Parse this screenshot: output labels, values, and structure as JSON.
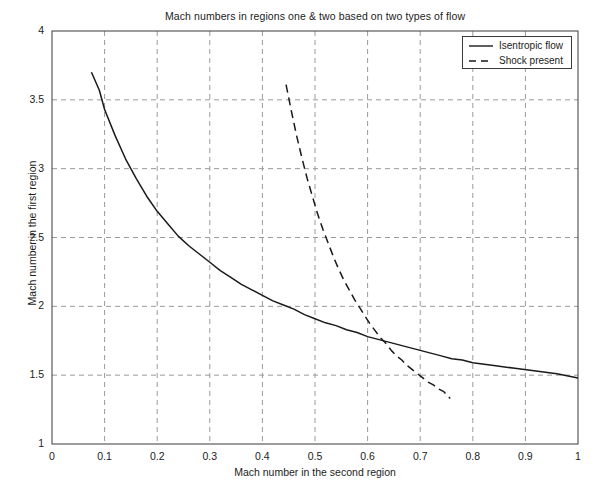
{
  "chart_data": {
    "type": "line",
    "title": "Mach numbers in regions one & two based on two types of flow",
    "xlabel": "Mach number in the second region",
    "ylabel": "Mach number in the first region",
    "xlim": [
      0,
      1
    ],
    "ylim": [
      1,
      4
    ],
    "grid": true,
    "grid_style": "dashed",
    "grid_color": "#9a9a9a",
    "legend_position": "top-right",
    "xticks": [
      "0",
      "0.1",
      "0.2",
      "0.3",
      "0.4",
      "0.5",
      "0.6",
      "0.7",
      "0.8",
      "0.9",
      "1"
    ],
    "xtick_values": [
      0,
      0.1,
      0.2,
      0.3,
      0.4,
      0.5,
      0.6,
      0.7,
      0.8,
      0.9,
      1
    ],
    "yticks": [
      "1",
      "1.5",
      "2",
      "2.5",
      "3",
      "3.5",
      "4"
    ],
    "ytick_values": [
      1,
      1.5,
      2,
      2.5,
      3,
      3.5,
      4
    ],
    "series": [
      {
        "name": "Isentropic flow",
        "style": "solid",
        "color": "#1a1a1a",
        "x": [
          0.075,
          0.09,
          0.1,
          0.12,
          0.14,
          0.16,
          0.18,
          0.2,
          0.22,
          0.24,
          0.26,
          0.28,
          0.3,
          0.32,
          0.34,
          0.36,
          0.38,
          0.4,
          0.42,
          0.44,
          0.46,
          0.48,
          0.5,
          0.52,
          0.54,
          0.56,
          0.58,
          0.6,
          0.62,
          0.64,
          0.66,
          0.68,
          0.7,
          0.72,
          0.74,
          0.76,
          0.78,
          0.8,
          0.84,
          0.88,
          0.92,
          0.96,
          1.0
        ],
        "y": [
          3.7,
          3.57,
          3.43,
          3.24,
          3.07,
          2.93,
          2.8,
          2.69,
          2.6,
          2.51,
          2.44,
          2.38,
          2.32,
          2.26,
          2.21,
          2.16,
          2.12,
          2.08,
          2.04,
          2.01,
          1.98,
          1.94,
          1.91,
          1.88,
          1.86,
          1.83,
          1.81,
          1.78,
          1.76,
          1.74,
          1.72,
          1.7,
          1.68,
          1.66,
          1.64,
          1.62,
          1.61,
          1.59,
          1.57,
          1.55,
          1.53,
          1.51,
          1.48
        ]
      },
      {
        "name": "Shock present",
        "style": "dashed",
        "color": "#1a1a1a",
        "x": [
          0.445,
          0.455,
          0.465,
          0.475,
          0.485,
          0.495,
          0.505,
          0.515,
          0.525,
          0.535,
          0.545,
          0.555,
          0.565,
          0.575,
          0.585,
          0.595,
          0.605,
          0.615,
          0.625,
          0.635,
          0.645,
          0.655,
          0.665,
          0.675,
          0.685,
          0.695,
          0.705,
          0.715,
          0.725,
          0.735,
          0.745,
          0.757
        ],
        "y": [
          3.61,
          3.42,
          3.24,
          3.08,
          2.93,
          2.8,
          2.67,
          2.56,
          2.46,
          2.36,
          2.27,
          2.19,
          2.12,
          2.05,
          1.99,
          1.93,
          1.87,
          1.82,
          1.77,
          1.73,
          1.68,
          1.64,
          1.61,
          1.57,
          1.54,
          1.51,
          1.48,
          1.45,
          1.43,
          1.4,
          1.38,
          1.33
        ]
      }
    ],
    "annotations": {
      "curve_intersection": {
        "x": 0.646,
        "y": 1.645
      }
    }
  },
  "legend": {
    "items": [
      {
        "label": "Isentropic flow",
        "style": "solid"
      },
      {
        "label": "Shock present",
        "style": "dashed"
      }
    ]
  }
}
